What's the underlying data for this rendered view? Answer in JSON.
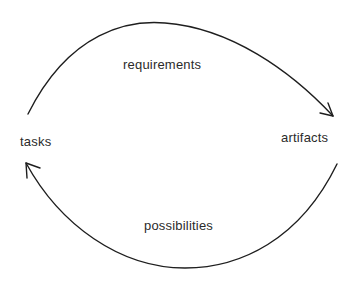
{
  "diagram": {
    "type": "cycle",
    "nodes": [
      {
        "id": "tasks",
        "label": "tasks"
      },
      {
        "id": "artifacts",
        "label": "artifacts"
      }
    ],
    "edges": [
      {
        "from": "tasks",
        "to": "artifacts",
        "label": "requirements",
        "curve": "upper-arc"
      },
      {
        "from": "artifacts",
        "to": "tasks",
        "label": "possibilities",
        "curve": "lower-arc"
      }
    ],
    "stroke_color": "#1e1e1e",
    "text_color": "#2b2b2b",
    "background": "#ffffff"
  }
}
